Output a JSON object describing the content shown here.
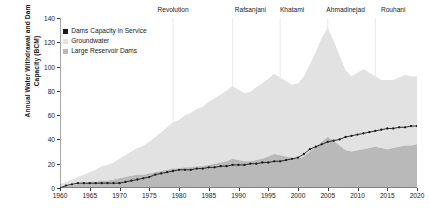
{
  "chart_data": {
    "type": "area",
    "title": "",
    "xlabel": "",
    "ylabel": "Annual Water Withdrawal and Dam Capacity (BCM)",
    "ylabel_line1": "Annual Water Withdrawal and Dam",
    "ylabel_line2": "Capacity (BCM)",
    "xlim": [
      1960,
      2020
    ],
    "ylim": [
      0,
      140
    ],
    "ytick_values": [
      0,
      20,
      40,
      60,
      80,
      100,
      120,
      140
    ],
    "xtick_values": [
      1960,
      1965,
      1970,
      1975,
      1980,
      1985,
      1990,
      1995,
      2000,
      2005,
      2010,
      2015,
      2020
    ],
    "grid": false,
    "legend_position": "upper-left-inside",
    "stacked": true,
    "colors": {
      "groundwater": "#e2e2e2",
      "large_reservoir_dams": "#b9b9b9",
      "dams_capacity_in_service": "#1a1a1a",
      "axis": "#3a3a3a",
      "era_divider": "#ededed",
      "background": "#ffffff"
    },
    "legend": [
      {
        "label": "Dams Capacity in Service",
        "color": "#1a1a1a",
        "marker": "square"
      },
      {
        "label": "Groundwater",
        "color": "#e2e2e2",
        "marker": "square"
      },
      {
        "label": "Large Reservoir Dams",
        "color": "#b9b9b9",
        "marker": "square"
      }
    ],
    "annotations": [
      {
        "label": "Revolution",
        "x": 1979
      },
      {
        "label": "Rafsanjani",
        "x": 1992
      },
      {
        "label": "Khatami",
        "x": 1999
      },
      {
        "label": "Ahmadinejad",
        "x": 2008
      },
      {
        "label": "Rouhani",
        "x": 2016
      }
    ],
    "era_dividers": [
      1979,
      1989,
      1997,
      2005,
      2013
    ],
    "x": [
      1960,
      1961,
      1962,
      1963,
      1964,
      1965,
      1966,
      1967,
      1968,
      1969,
      1970,
      1971,
      1972,
      1973,
      1974,
      1975,
      1976,
      1977,
      1978,
      1979,
      1980,
      1981,
      1982,
      1983,
      1984,
      1985,
      1986,
      1987,
      1988,
      1989,
      1990,
      1991,
      1992,
      1993,
      1994,
      1995,
      1996,
      1997,
      1998,
      1999,
      2000,
      2001,
      2002,
      2003,
      2004,
      2005,
      2006,
      2007,
      2008,
      2009,
      2010,
      2011,
      2012,
      2013,
      2014,
      2015,
      2016,
      2017,
      2018,
      2019,
      2020
    ],
    "series": [
      {
        "name": "Large Reservoir Dams",
        "color": "#b9b9b9",
        "values": [
          0,
          1,
          2,
          3,
          4,
          5,
          5,
          6,
          6,
          7,
          8,
          9,
          10,
          11,
          11,
          12,
          13,
          14,
          15,
          16,
          16,
          17,
          17,
          18,
          18,
          19,
          20,
          21,
          22,
          24,
          23,
          22,
          22,
          23,
          24,
          26,
          28,
          27,
          26,
          25,
          24,
          26,
          30,
          34,
          38,
          42,
          39,
          35,
          31,
          30,
          31,
          32,
          33,
          34,
          33,
          32,
          33,
          34,
          35,
          35,
          36
        ]
      },
      {
        "name": "Groundwater",
        "color": "#e2e2e2",
        "values": [
          3,
          4,
          5,
          6,
          7,
          8,
          10,
          12,
          13,
          14,
          16,
          18,
          20,
          22,
          24,
          26,
          29,
          32,
          35,
          38,
          40,
          43,
          45,
          47,
          49,
          52,
          54,
          56,
          58,
          60,
          58,
          56,
          57,
          60,
          62,
          64,
          66,
          64,
          62,
          60,
          62,
          66,
          72,
          78,
          86,
          90,
          82,
          74,
          66,
          62,
          64,
          66,
          62,
          58,
          56,
          57,
          56,
          57,
          58,
          57,
          56
        ]
      }
    ],
    "line_series": {
      "name": "Dams Capacity in Service",
      "color": "#1a1a1a",
      "marker": "dot",
      "values": [
        0,
        2,
        3,
        4,
        4,
        4,
        4,
        4,
        4,
        4,
        4,
        5,
        6,
        7,
        8,
        9,
        11,
        12,
        13,
        14,
        15,
        15,
        15,
        16,
        16,
        17,
        17,
        18,
        18,
        19,
        19,
        19,
        20,
        20,
        21,
        21,
        22,
        22,
        23,
        24,
        25,
        28,
        32,
        34,
        36,
        38,
        39,
        40,
        42,
        43,
        44,
        45,
        46,
        47,
        48,
        49,
        49,
        50,
        50,
        51,
        51
      ]
    }
  }
}
